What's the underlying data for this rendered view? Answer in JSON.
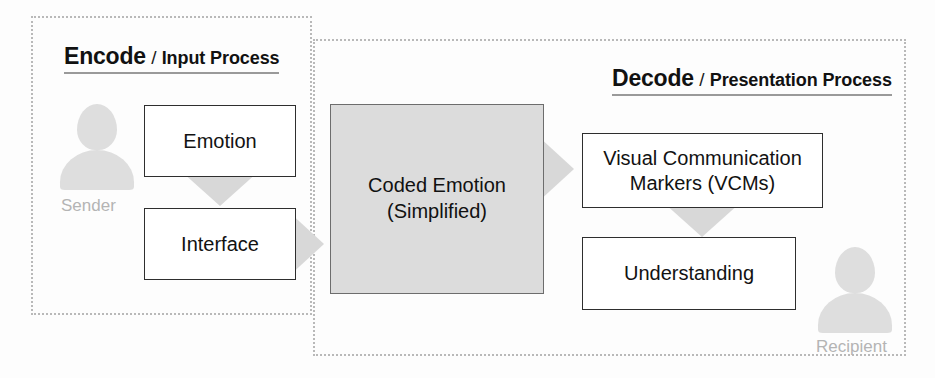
{
  "diagram": {
    "colors": {
      "dashed_border": "#b9b9b9",
      "box_border": "#2e2e2e",
      "coded_box_fill": "#dcdcdc",
      "arrow_fill": "#d8d8d8",
      "silhouette_fill": "#dedede",
      "person_label": "#b4b4b4",
      "text": "#121212",
      "background": "#fdfdfd"
    },
    "encode": {
      "heading_strong": "Encode",
      "heading_separator": "/",
      "heading_light": "Input Process",
      "person": {
        "label": "Sender",
        "icon": "person-silhouette-icon"
      },
      "nodes": [
        {
          "id": "emotion",
          "label": "Emotion"
        },
        {
          "id": "interface",
          "label": "Interface"
        }
      ],
      "arrows": [
        {
          "id": "emotion-to-interface",
          "direction": "down"
        },
        {
          "id": "interface-to-coded-emotion",
          "direction": "right"
        }
      ]
    },
    "channel": {
      "id": "coded-emotion",
      "label_line1": "Coded Emotion",
      "label_line2": "(Simplified)"
    },
    "decode": {
      "heading_strong": "Decode",
      "heading_separator": "/",
      "heading_light": "Presentation Process",
      "person": {
        "label": "Recipient",
        "icon": "person-silhouette-icon"
      },
      "nodes": [
        {
          "id": "vcm",
          "label_line1": "Visual Communication",
          "label_line2": "Markers (VCMs)"
        },
        {
          "id": "understanding",
          "label": "Understanding"
        }
      ],
      "arrows": [
        {
          "id": "coded-emotion-to-vcm",
          "direction": "right"
        },
        {
          "id": "vcm-to-understanding",
          "direction": "down"
        }
      ]
    }
  }
}
